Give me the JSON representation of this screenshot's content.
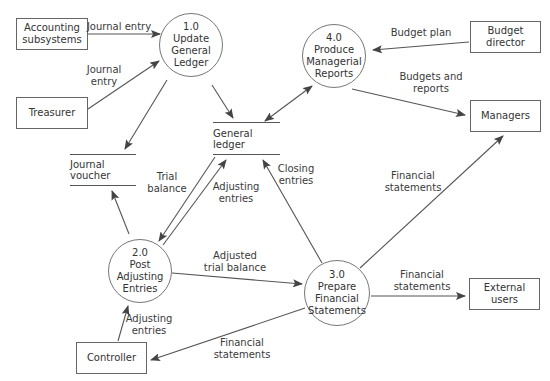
{
  "diagram": {
    "type": "data-flow-diagram",
    "processes": [
      {
        "id": "1.0",
        "lines": [
          "1.0",
          "Update",
          "General",
          "Ledger"
        ]
      },
      {
        "id": "2.0",
        "lines": [
          "2.0",
          "Post",
          "Adjusting",
          "Entries"
        ]
      },
      {
        "id": "3.0",
        "lines": [
          "3.0",
          "Prepare",
          "Financial",
          "Statements"
        ]
      },
      {
        "id": "4.0",
        "lines": [
          "4.0",
          "Produce",
          "Managerial",
          "Reports"
        ]
      }
    ],
    "entities": {
      "accounting_subsystems": [
        "Accounting",
        "subsystems"
      ],
      "treasurer": [
        "Treasurer"
      ],
      "budget_director": [
        "Budget",
        "director"
      ],
      "managers": [
        "Managers"
      ],
      "external_users": [
        "External",
        "users"
      ],
      "controller": [
        "Controller"
      ]
    },
    "stores": {
      "general_ledger": "General ledger",
      "journal_voucher": "Journal voucher"
    },
    "flows": {
      "journal_entry_1": [
        "Journal entry"
      ],
      "journal_entry_2": [
        "Journal",
        "entry"
      ],
      "budget_plan": [
        "Budget plan"
      ],
      "budgets_and_reports": [
        "Budgets and",
        "reports"
      ],
      "trial_balance": [
        "Trial",
        "balance"
      ],
      "adjusting_entries_gl": [
        "Adjusting",
        "entries"
      ],
      "closing_entries": [
        "Closing",
        "entries"
      ],
      "financial_statements_managers": [
        "Financial",
        "statements"
      ],
      "adjusted_trial_balance": [
        "Adjusted",
        "trial balance"
      ],
      "financial_statements_external": [
        "Financial",
        "statements"
      ],
      "adjusting_entries_controller": [
        "Adjusting",
        "entries"
      ],
      "financial_statements_controller": [
        "Financial",
        "statements"
      ]
    }
  }
}
